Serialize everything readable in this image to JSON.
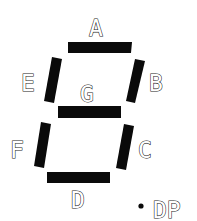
{
  "diagram": {
    "segment_color": "#0a0a0a",
    "segments": [
      {
        "id": "A",
        "label": "A"
      },
      {
        "id": "B",
        "label": "B"
      },
      {
        "id": "C",
        "label": "C"
      },
      {
        "id": "D",
        "label": "D"
      },
      {
        "id": "E",
        "label": "E"
      },
      {
        "id": "F",
        "label": "F"
      },
      {
        "id": "G",
        "label": "G"
      }
    ],
    "decimal_point": {
      "label": "DP"
    }
  }
}
